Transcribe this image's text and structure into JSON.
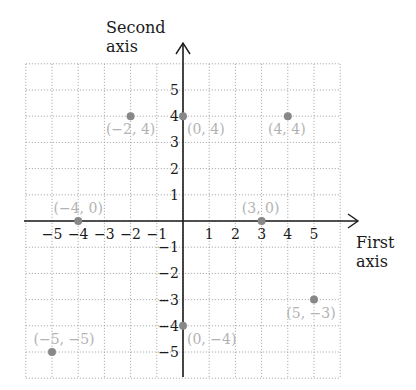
{
  "chart_data": {
    "type": "scatter",
    "title": "",
    "xlabel": "First axis",
    "ylabel": "Second axis",
    "xlim": [
      -6,
      6
    ],
    "ylim": [
      -6,
      6
    ],
    "grid": true,
    "x_ticks": [
      -5,
      -4,
      -3,
      -2,
      -1,
      1,
      2,
      3,
      4,
      5
    ],
    "y_ticks": [
      -5,
      -4,
      -3,
      -2,
      -1,
      1,
      2,
      3,
      4,
      5
    ],
    "points": [
      {
        "x": -2,
        "y": 4,
        "label": "(−2, 4)"
      },
      {
        "x": 0,
        "y": 4,
        "label": "(0, 4)"
      },
      {
        "x": 4,
        "y": 4,
        "label": "(4, 4)"
      },
      {
        "x": -4,
        "y": 0,
        "label": "(−4, 0)"
      },
      {
        "x": 3,
        "y": 0,
        "label": "(3, 0)"
      },
      {
        "x": 5,
        "y": -3,
        "label": "(5, −3)"
      },
      {
        "x": 0,
        "y": -4,
        "label": "(0, −4)"
      },
      {
        "x": -5,
        "y": -5,
        "label": "(−5, −5)"
      }
    ]
  },
  "axes": {
    "x_title_line1": "First",
    "x_title_line2": "axis",
    "y_title_line1": "Second",
    "y_title_line2": "axis"
  },
  "colors": {
    "point": "#888888",
    "label": "#b3b3b3",
    "grid": "#9a9a9a",
    "axis": "#1a1a1a"
  }
}
